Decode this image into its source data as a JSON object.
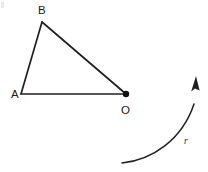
{
  "figure": {
    "width": 208,
    "height": 172,
    "background_color": "#ffffff",
    "stroke_color": "#1f1f1f",
    "label_color": "#1a1a1a",
    "vertices": [
      {
        "name": "A",
        "label": "A",
        "x": 21,
        "y": 94,
        "label_x": 11,
        "label_y": 98,
        "dot": false
      },
      {
        "name": "B",
        "label": "B",
        "x": 42,
        "y": 22,
        "label_x": 38,
        "label_y": 14,
        "dot": false
      },
      {
        "name": "O",
        "label": "O",
        "x": 126,
        "y": 94,
        "label_x": 122,
        "label_y": 114,
        "dot": true
      }
    ],
    "edges": [
      {
        "name": "edge-A-B",
        "from": "A",
        "to": "B"
      },
      {
        "name": "edge-B-O",
        "from": "B",
        "to": "O"
      },
      {
        "name": "edge-A-O",
        "from": "A",
        "to": "O"
      }
    ],
    "rotation_arrow": {
      "label": "r",
      "label_x": 184,
      "label_y": 144,
      "path": "M 122 163 C 152 160 182 140 194 104",
      "arrowhead": "M 196 76 L 191.5 90.5 L 195.2 88.2 L 199.4 89.9 Z",
      "direction": "counterclockwise-upward"
    }
  }
}
